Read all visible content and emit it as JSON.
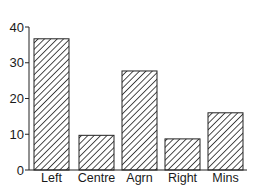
{
  "chart_data": {
    "type": "bar",
    "title": "",
    "xlabel": "",
    "ylabel": "",
    "categories": [
      "Left",
      "Centre",
      "Agrn",
      "Right",
      "Mins"
    ],
    "values": [
      36.7,
      9.7,
      27.7,
      8.7,
      16.0
    ],
    "ylim": [
      0,
      40
    ],
    "yticks": [
      0,
      10,
      20,
      30,
      40
    ],
    "grid": false,
    "legend": null,
    "bar_style": "diagonal-hatch",
    "colors": {
      "bar_fill": "#ffffff",
      "hatch": "#222222",
      "axis": "#222222"
    }
  },
  "axis": {
    "ytick_labels": [
      "0",
      "10",
      "20",
      "30",
      "40"
    ]
  }
}
